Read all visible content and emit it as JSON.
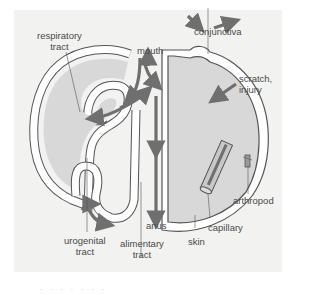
{
  "diagram": {
    "labels": {
      "respiratory_tract": "respiratory\ntract",
      "mouth": "mouth",
      "conjunctiva": "conjunctiva",
      "scratch_injury": "scratch,\ninjury",
      "arthropod": "arthropod",
      "capillary": "capillary",
      "skin": "skin",
      "anus": "anus",
      "alimentary_tract": "alimentary\ntract",
      "urogenital_tract": "urogenital\ntract"
    },
    "caption": "· · · · · · ·"
  },
  "colors": {
    "background": "#f2f2f0",
    "body_fill": "#d8d8d8",
    "skin_band": "#ffffff",
    "arrow": "#6f6f6f",
    "outline": "#555555"
  }
}
